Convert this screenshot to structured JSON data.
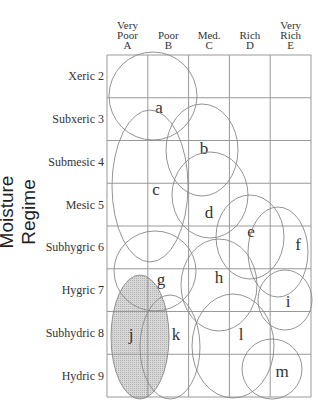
{
  "title_fragment": "g",
  "y_axis_label": "Moisture Regime",
  "columns": [
    {
      "l1": "Very",
      "l2": "Poor",
      "l3": "A"
    },
    {
      "l1": "",
      "l2": "Poor",
      "l3": "B"
    },
    {
      "l1": "",
      "l2": "Med.",
      "l3": "C"
    },
    {
      "l1": "",
      "l2": "Rich",
      "l3": "D"
    },
    {
      "l1": "Very",
      "l2": "Rich",
      "l3": "E"
    }
  ],
  "rows": [
    "Xeric 2",
    "Subxeric 3",
    "Submesic 4",
    "Mesic 5",
    "Subhygric 6",
    "Hygric 7",
    "Subhydric 8",
    "Hydric 9"
  ],
  "grid": {
    "x0": 107,
    "y0": 55,
    "cw": 40.8,
    "rh": 42.75,
    "ncols": 5,
    "nrows": 8
  },
  "ellipses": [
    {
      "id": "a",
      "cx": 153,
      "cy": 96,
      "rx": 44,
      "ry": 44,
      "lx": 159,
      "ly": 113,
      "fill": false
    },
    {
      "id": "b",
      "cx": 202,
      "cy": 150,
      "rx": 36,
      "ry": 46,
      "lx": 204,
      "ly": 154,
      "fill": false
    },
    {
      "id": "c",
      "cx": 150,
      "cy": 186,
      "rx": 38,
      "ry": 76,
      "lx": 156,
      "ly": 195,
      "fill": false
    },
    {
      "id": "d",
      "cx": 210,
      "cy": 195,
      "rx": 38,
      "ry": 43,
      "lx": 209,
      "ly": 218,
      "fill": false
    },
    {
      "id": "e",
      "cx": 250,
      "cy": 237,
      "rx": 34,
      "ry": 42,
      "lx": 251,
      "ly": 237,
      "fill": false
    },
    {
      "id": "f",
      "cx": 278,
      "cy": 252,
      "rx": 30,
      "ry": 45,
      "lx": 298,
      "ly": 250,
      "fill": false
    },
    {
      "id": "g",
      "cx": 155,
      "cy": 271,
      "rx": 41,
      "ry": 40,
      "lx": 161,
      "ly": 285,
      "fill": false
    },
    {
      "id": "h",
      "cx": 219,
      "cy": 285,
      "rx": 38,
      "ry": 46,
      "lx": 219,
      "ly": 283,
      "fill": false
    },
    {
      "id": "i",
      "cx": 285,
      "cy": 300,
      "rx": 27,
      "ry": 30,
      "lx": 288,
      "ly": 307,
      "fill": false
    },
    {
      "id": "j",
      "cx": 140,
      "cy": 337,
      "rx": 29,
      "ry": 62,
      "lx": 131,
      "ly": 340,
      "fill": true
    },
    {
      "id": "k",
      "cx": 170,
      "cy": 347,
      "rx": 30,
      "ry": 52,
      "lx": 176,
      "ly": 340,
      "fill": false
    },
    {
      "id": "l",
      "cx": 233,
      "cy": 346,
      "rx": 41,
      "ry": 52,
      "lx": 241,
      "ly": 340,
      "fill": false
    },
    {
      "id": "m",
      "cx": 272,
      "cy": 369,
      "rx": 30,
      "ry": 30,
      "lx": 282,
      "ly": 377,
      "fill": false
    }
  ],
  "colors": {
    "line": "#888888",
    "grid": "#999999",
    "fill": "#d8d8d8",
    "text": "#333333"
  }
}
